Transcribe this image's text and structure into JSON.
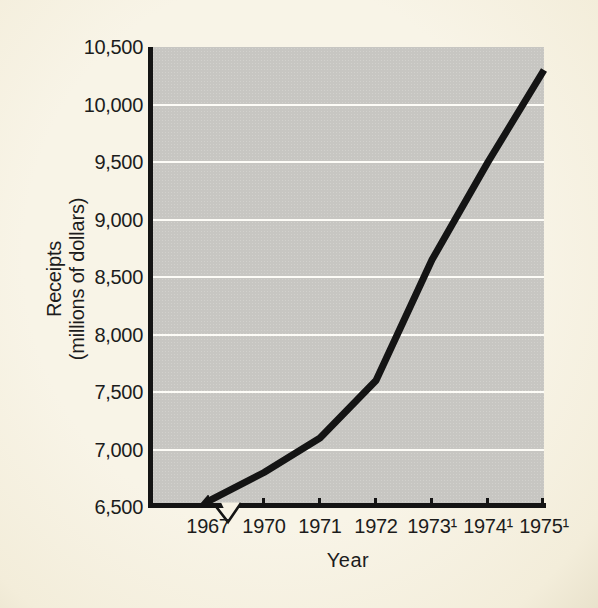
{
  "figure": {
    "background_color": "#f7f2e4",
    "plot_background_color": "#c7c6c2",
    "gridline_color": "#ffffff",
    "line_color": "#141414",
    "axis_color": "#141414",
    "text_color": "#1c1c1c"
  },
  "chart_data": {
    "type": "line",
    "title": "",
    "xlabel": "Year",
    "ylabel": "Receipts (millions of dollars)",
    "ylabel_lines": [
      "Receipts",
      "(millions of dollars)"
    ],
    "categories": [
      "1967",
      "1970",
      "1971",
      "1972",
      "1973¹",
      "1974¹",
      "1975¹"
    ],
    "values": [
      6550,
      6800,
      7100,
      7600,
      8650,
      9500,
      10300
    ],
    "ylim": [
      6500,
      10500
    ],
    "y_tick_interval": 500,
    "y_tick_labels_top_to_bottom": [
      "10,500",
      "10,000",
      "9,500",
      "9,000",
      "8,500",
      "8,000",
      "7,500",
      "7,000",
      "6,500"
    ],
    "grid": "horizontal-white-lines",
    "legend": "none",
    "annotations": {
      "x_axis_break_after": "1967",
      "line_start_arrow": "solid arrowhead pointing down-left onto baseline at 1967",
      "footnote_marker_on": [
        "1973",
        "1974",
        "1975"
      ]
    }
  }
}
